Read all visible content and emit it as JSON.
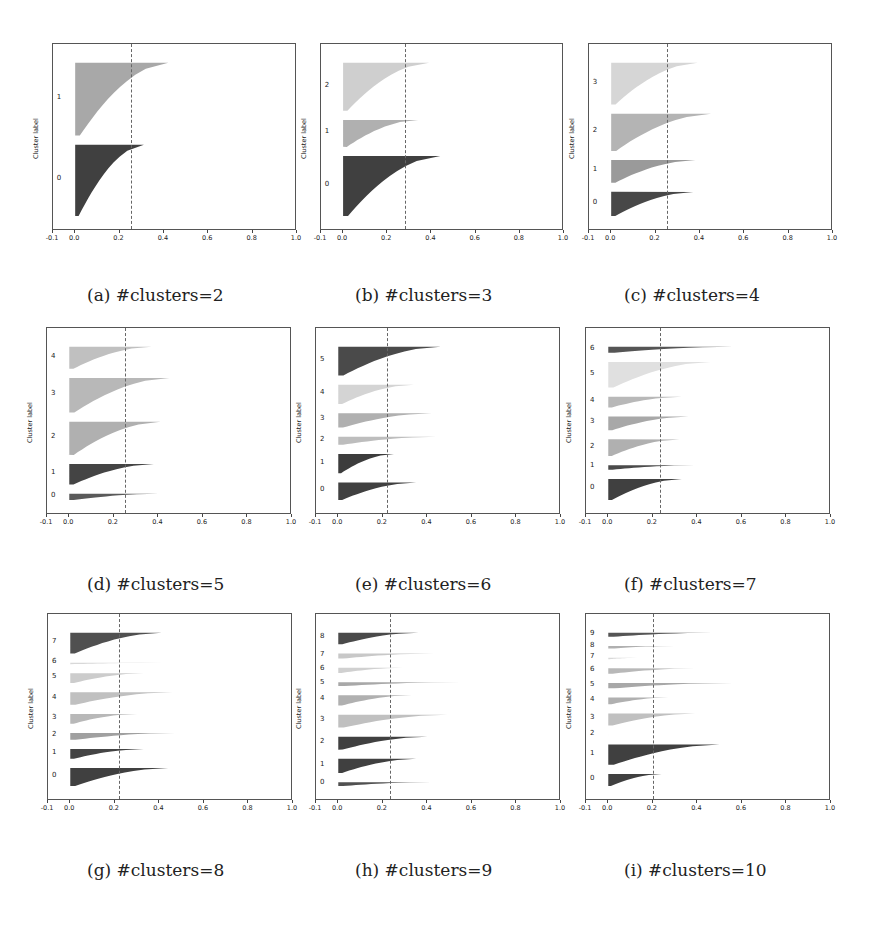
{
  "captions": [
    "(a) #clusters=2",
    "(b) #clusters=3",
    "(c) #clusters=4",
    "(d) #clusters=5",
    "(e) #clusters=6",
    "(f) #clusters=7",
    "(g) #clusters=8",
    "(h) #clusters=9",
    "(i) #clusters=10"
  ],
  "axis": {
    "ylabel": "Cluster label",
    "xticks": [
      "-0.1",
      "0.0",
      "0.2",
      "0.4",
      "0.6",
      "0.8",
      "1.0"
    ],
    "xlim": [
      -0.1,
      1.0
    ]
  },
  "chart_data": [
    {
      "type": "bar",
      "title": "(a) #clusters=2",
      "xlabel": "",
      "ylabel": "Cluster label",
      "xlim": [
        -0.1,
        1.0
      ],
      "mean_silhouette": 0.25,
      "clusters": [
        {
          "label": "0",
          "max": 0.31,
          "min": 0.0,
          "size": 0.43,
          "color": "#404040"
        },
        {
          "label": "1",
          "max": 0.42,
          "min": 0.0,
          "size": 0.44,
          "color": "#a8a8a8"
        }
      ]
    },
    {
      "type": "bar",
      "title": "(b) #clusters=3",
      "xlabel": "",
      "ylabel": "Cluster label",
      "xlim": [
        -0.1,
        1.0
      ],
      "mean_silhouette": 0.28,
      "clusters": [
        {
          "label": "0",
          "max": 0.44,
          "min": 0.0,
          "size": 0.4,
          "color": "#404040"
        },
        {
          "label": "1",
          "max": 0.34,
          "min": 0.0,
          "size": 0.18,
          "color": "#b0b0b0"
        },
        {
          "label": "2",
          "max": 0.39,
          "min": 0.0,
          "size": 0.32,
          "color": "#cfcfcf"
        }
      ]
    },
    {
      "type": "bar",
      "title": "(c) #clusters=4",
      "xlabel": "",
      "ylabel": "Cluster label",
      "xlim": [
        -0.1,
        1.0
      ],
      "mean_silhouette": 0.25,
      "clusters": [
        {
          "label": "0",
          "max": 0.37,
          "min": 0.0,
          "size": 0.15,
          "color": "#484848"
        },
        {
          "label": "1",
          "max": 0.38,
          "min": 0.0,
          "size": 0.14,
          "color": "#9a9a9a"
        },
        {
          "label": "2",
          "max": 0.45,
          "min": 0.0,
          "size": 0.23,
          "color": "#b4b4b4"
        },
        {
          "label": "3",
          "max": 0.39,
          "min": 0.0,
          "size": 0.26,
          "color": "#d6d6d6"
        }
      ]
    },
    {
      "type": "bar",
      "title": "(d) #clusters=5",
      "xlabel": "",
      "ylabel": "Cluster label",
      "xlim": [
        -0.1,
        1.0
      ],
      "mean_silhouette": 0.25,
      "clusters": [
        {
          "label": "0",
          "max": 0.4,
          "min": 0.0,
          "size": 0.04,
          "color": "#5a5a5a"
        },
        {
          "label": "1",
          "max": 0.38,
          "min": 0.0,
          "size": 0.13,
          "color": "#444444"
        },
        {
          "label": "2",
          "max": 0.41,
          "min": -0.01,
          "size": 0.21,
          "color": "#b0b0b0"
        },
        {
          "label": "3",
          "max": 0.45,
          "min": 0.0,
          "size": 0.22,
          "color": "#b8b8b8"
        },
        {
          "label": "4",
          "max": 0.37,
          "min": 0.0,
          "size": 0.14,
          "color": "#c0c0c0"
        }
      ]
    },
    {
      "type": "bar",
      "title": "(e) #clusters=6",
      "xlabel": "",
      "ylabel": "Cluster label",
      "xlim": [
        -0.1,
        1.0
      ],
      "mean_silhouette": 0.22,
      "clusters": [
        {
          "label": "0",
          "max": 0.35,
          "min": 0.0,
          "size": 0.11,
          "color": "#404040"
        },
        {
          "label": "1",
          "max": 0.25,
          "min": -0.02,
          "size": 0.12,
          "color": "#3c3c3c"
        },
        {
          "label": "2",
          "max": 0.44,
          "min": 0.0,
          "size": 0.05,
          "color": "#bdbdbd"
        },
        {
          "label": "3",
          "max": 0.42,
          "min": -0.01,
          "size": 0.09,
          "color": "#b0b0b0"
        },
        {
          "label": "4",
          "max": 0.34,
          "min": -0.03,
          "size": 0.12,
          "color": "#d4d4d4"
        },
        {
          "label": "5",
          "max": 0.46,
          "min": 0.0,
          "size": 0.18,
          "color": "#4a4a4a"
        }
      ]
    },
    {
      "type": "bar",
      "title": "(f) #clusters=7",
      "xlabel": "",
      "ylabel": "Cluster label",
      "xlim": [
        -0.1,
        1.0
      ],
      "mean_silhouette": 0.23,
      "clusters": [
        {
          "label": "0",
          "max": 0.33,
          "min": 0.0,
          "size": 0.14,
          "color": "#404040"
        },
        {
          "label": "1",
          "max": 0.39,
          "min": 0.0,
          "size": 0.03,
          "color": "#4a4a4a"
        },
        {
          "label": "2",
          "max": 0.32,
          "min": 0.0,
          "size": 0.11,
          "color": "#b0b0b0"
        },
        {
          "label": "3",
          "max": 0.36,
          "min": -0.1,
          "size": 0.09,
          "color": "#a8a8a8"
        },
        {
          "label": "4",
          "max": 0.33,
          "min": 0.0,
          "size": 0.07,
          "color": "#b8b8b8"
        },
        {
          "label": "5",
          "max": 0.46,
          "min": 0.0,
          "size": 0.17,
          "color": "#e0e0e0"
        },
        {
          "label": "6",
          "max": 0.56,
          "min": 0.0,
          "size": 0.04,
          "color": "#555555"
        }
      ]
    },
    {
      "type": "bar",
      "title": "(g) #clusters=8",
      "xlabel": "",
      "ylabel": "Cluster label",
      "xlim": [
        -0.1,
        1.0
      ],
      "mean_silhouette": 0.22,
      "clusters": [
        {
          "label": "0",
          "max": 0.44,
          "min": -0.04,
          "size": 0.13,
          "color": "#404040"
        },
        {
          "label": "1",
          "max": 0.33,
          "min": 0.0,
          "size": 0.07,
          "color": "#444444"
        },
        {
          "label": "2",
          "max": 0.47,
          "min": 0.0,
          "size": 0.05,
          "color": "#a0a0a0"
        },
        {
          "label": "3",
          "max": 0.3,
          "min": -0.01,
          "size": 0.07,
          "color": "#b8b8b8"
        },
        {
          "label": "4",
          "max": 0.46,
          "min": -0.1,
          "size": 0.09,
          "color": "#c0c0c0"
        },
        {
          "label": "5",
          "max": 0.33,
          "min": 0.0,
          "size": 0.07,
          "color": "#cccccc"
        },
        {
          "label": "6",
          "max": 0.42,
          "min": 0.0,
          "size": 0.01,
          "color": "#d8d8d8"
        },
        {
          "label": "7",
          "max": 0.41,
          "min": 0.0,
          "size": 0.15,
          "color": "#505050"
        }
      ]
    },
    {
      "type": "bar",
      "title": "(h) #clusters=9",
      "xlabel": "",
      "ylabel": "Cluster label",
      "xlim": [
        -0.1,
        1.0
      ],
      "mean_silhouette": 0.23,
      "clusters": [
        {
          "label": "0",
          "max": 0.42,
          "min": 0.0,
          "size": 0.03,
          "color": "#505050"
        },
        {
          "label": "1",
          "max": 0.35,
          "min": -0.05,
          "size": 0.11,
          "color": "#404040"
        },
        {
          "label": "2",
          "max": 0.4,
          "min": 0.0,
          "size": 0.1,
          "color": "#404040"
        },
        {
          "label": "3",
          "max": 0.49,
          "min": 0.0,
          "size": 0.1,
          "color": "#c0c0c0"
        },
        {
          "label": "4",
          "max": 0.33,
          "min": -0.01,
          "size": 0.08,
          "color": "#b0b0b0"
        },
        {
          "label": "5",
          "max": 0.55,
          "min": 0.0,
          "size": 0.03,
          "color": "#a8a8a8"
        },
        {
          "label": "6",
          "max": 0.29,
          "min": 0.0,
          "size": 0.04,
          "color": "#d0d0d0"
        },
        {
          "label": "7",
          "max": 0.43,
          "min": 0.0,
          "size": 0.04,
          "color": "#c8c8c8"
        },
        {
          "label": "8",
          "max": 0.36,
          "min": 0.0,
          "size": 0.09,
          "color": "#4a4a4a"
        }
      ]
    },
    {
      "type": "bar",
      "title": "(i) #clusters=10",
      "xlabel": "",
      "ylabel": "Cluster label",
      "xlim": [
        -0.1,
        1.0
      ],
      "mean_silhouette": 0.2,
      "clusters": [
        {
          "label": "0",
          "max": 0.24,
          "min": -0.1,
          "size": 0.09,
          "color": "#404040"
        },
        {
          "label": "1",
          "max": 0.5,
          "min": 0.0,
          "size": 0.15,
          "color": "#404040"
        },
        {
          "label": "2",
          "max": 0.0,
          "min": 0.0,
          "size": 0.0,
          "color": "#888888"
        },
        {
          "label": "3",
          "max": 0.39,
          "min": 0.0,
          "size": 0.09,
          "color": "#c0c0c0"
        },
        {
          "label": "4",
          "max": 0.27,
          "min": 0.0,
          "size": 0.05,
          "color": "#b0b0b0"
        },
        {
          "label": "5",
          "max": 0.56,
          "min": -0.1,
          "size": 0.04,
          "color": "#a8a8a8"
        },
        {
          "label": "6",
          "max": 0.39,
          "min": -0.09,
          "size": 0.04,
          "color": "#b8b8b8"
        },
        {
          "label": "7",
          "max": 0.13,
          "min": 0.0,
          "size": 0.01,
          "color": "#d8d8d8"
        },
        {
          "label": "8",
          "max": 0.3,
          "min": -0.05,
          "size": 0.02,
          "color": "#b0b0b0"
        },
        {
          "label": "9",
          "max": 0.47,
          "min": 0.0,
          "size": 0.03,
          "color": "#555555"
        }
      ]
    }
  ]
}
